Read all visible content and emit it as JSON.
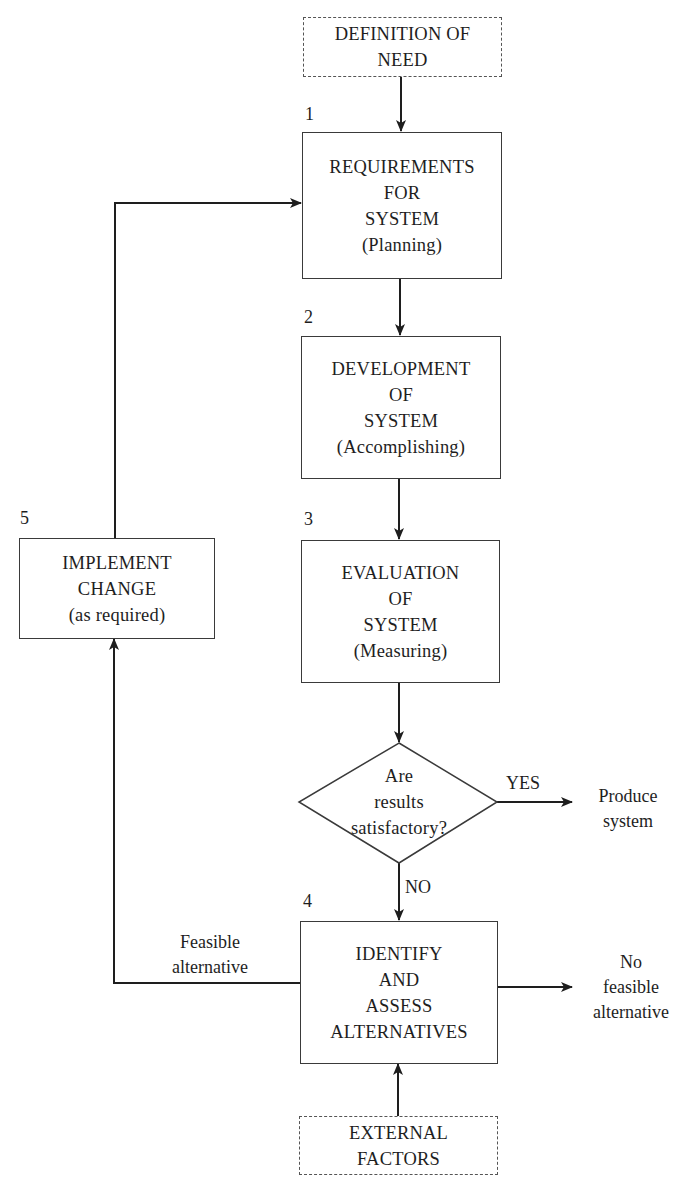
{
  "diagram": {
    "type": "flowchart",
    "nodes": {
      "definition_of_need": {
        "lines": [
          "DEFINITION OF",
          "NEED"
        ],
        "style": "dashed"
      },
      "box1": {
        "number": "1",
        "lines": [
          "REQUIREMENTS",
          "FOR",
          "SYSTEM",
          "(Planning)"
        ]
      },
      "box2": {
        "number": "2",
        "lines": [
          "DEVELOPMENT",
          "OF",
          "SYSTEM",
          "(Accomplishing)"
        ]
      },
      "box3": {
        "number": "3",
        "lines": [
          "EVALUATION",
          "OF",
          "SYSTEM",
          "(Measuring)"
        ]
      },
      "decision": {
        "lines": [
          "Are",
          "results",
          "satisfactory?"
        ]
      },
      "box4": {
        "number": "4",
        "lines": [
          "IDENTIFY",
          "AND",
          "ASSESS",
          "ALTERNATIVES"
        ]
      },
      "box5": {
        "number": "5",
        "lines": [
          "IMPLEMENT",
          "CHANGE",
          "(as required)"
        ]
      },
      "external_factors": {
        "lines": [
          "EXTERNAL",
          "FACTORS"
        ],
        "style": "dashed"
      }
    },
    "edge_labels": {
      "yes": "YES",
      "no": "NO",
      "produce_system": [
        "Produce",
        "system"
      ],
      "feasible_alternative": [
        "Feasible",
        "alternative"
      ],
      "no_feasible_alternative": [
        "No",
        "feasible",
        "alternative"
      ]
    },
    "edges": [
      {
        "from": "definition_of_need",
        "to": "box1"
      },
      {
        "from": "box1",
        "to": "box2"
      },
      {
        "from": "box2",
        "to": "box3"
      },
      {
        "from": "box3",
        "to": "decision"
      },
      {
        "from": "decision",
        "to": "produce_system",
        "label": "YES"
      },
      {
        "from": "decision",
        "to": "box4",
        "label": "NO"
      },
      {
        "from": "box4",
        "to": "box5",
        "label": "Feasible alternative"
      },
      {
        "from": "box5",
        "to": "box1"
      },
      {
        "from": "box4",
        "to": "no_feasible_alternative"
      },
      {
        "from": "external_factors",
        "to": "box4"
      }
    ],
    "colors": {
      "line": "#1e1e1e",
      "border": "#3a3a3a",
      "background": "#ffffff"
    }
  }
}
